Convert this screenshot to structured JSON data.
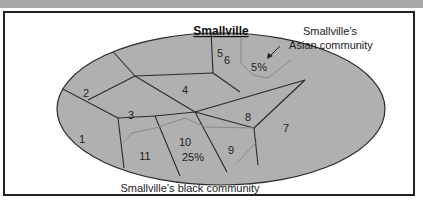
{
  "diagram": {
    "title": "Smallville",
    "colors": {
      "header_bar": "#a9a9a9",
      "ellipse_fill": "#b0b0b0",
      "boundary": "#2a2a2a",
      "community_boundary": "#8a8a8a"
    },
    "districts": [
      {
        "id": "1",
        "label": "1"
      },
      {
        "id": "2",
        "label": "2"
      },
      {
        "id": "3",
        "label": "3"
      },
      {
        "id": "4",
        "label": "4"
      },
      {
        "id": "5",
        "label": "5"
      },
      {
        "id": "6",
        "label": "6"
      },
      {
        "id": "7",
        "label": "7"
      },
      {
        "id": "8",
        "label": "8"
      },
      {
        "id": "9",
        "label": "9"
      },
      {
        "id": "10",
        "label": "10"
      },
      {
        "id": "11",
        "label": "11"
      }
    ],
    "community_labels": {
      "asian_pct": "5%",
      "black_pct": "25%"
    },
    "annotations": {
      "asian_line1": "Smallville’s",
      "asian_line2": "Asian community",
      "black": "Smallville’s  black community"
    }
  }
}
